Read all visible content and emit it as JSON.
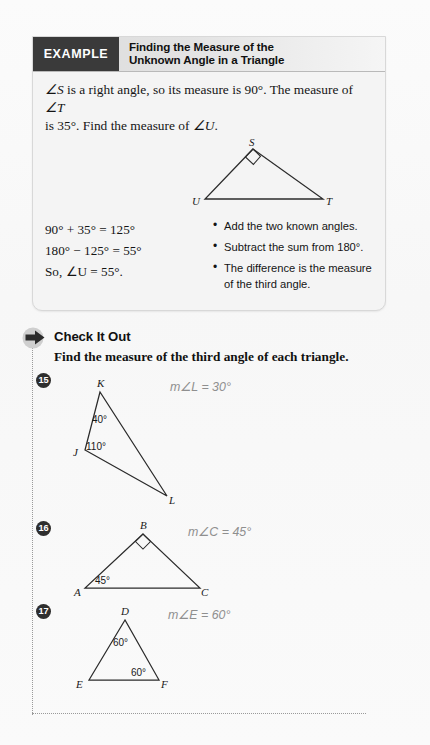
{
  "example": {
    "tag_label": "EXAMPLE",
    "title_line1": "Finding the Measure of the",
    "title_line2": "Unknown Angle in a Triangle",
    "problem_text_part1": "S",
    "problem_text": "∠S is a right angle, so its measure is 90°. The measure of ∠T is 35°. Find the measure of ∠U.",
    "figure": {
      "name": "right-triangle-SUT",
      "vertices": [
        {
          "label": "S",
          "x": 208,
          "y": 12
        },
        {
          "label": "U",
          "x": 160,
          "y": 62
        },
        {
          "label": "T",
          "x": 278,
          "y": 62
        }
      ],
      "right_angle_at": "S"
    },
    "steps": [
      "90° + 35° = 125°",
      "180° − 125° = 55°",
      "So, ∠U = 55°."
    ],
    "notes": [
      "Add the two known angles.",
      "Subtract the sum from 180°.",
      "The difference is the measure of the third angle."
    ],
    "bullet_glyph": "•"
  },
  "check_it_out": {
    "arrow_icon": "right-arrow-icon",
    "heading": "Check It Out",
    "instruction": "Find the measure of the third angle of each triangle.",
    "problems": [
      {
        "number": "15",
        "answer": "m∠L = 30°",
        "figure_name": "triangle-JKL",
        "vertices": [
          {
            "label": "K",
            "x": 45,
            "y": 22
          },
          {
            "label": "J",
            "x": 30,
            "y": 80
          },
          {
            "label": "L",
            "x": 112,
            "y": 126
          }
        ],
        "angles": [
          {
            "value": "40°",
            "at": "K"
          },
          {
            "value": "110°",
            "at": "J"
          }
        ],
        "right_angle_at": ""
      },
      {
        "number": "16",
        "answer": "m∠C = 45°",
        "figure_name": "triangle-ABC",
        "vertices": [
          {
            "label": "B",
            "x": 88,
            "y": 18
          },
          {
            "label": "A",
            "x": 30,
            "y": 72
          },
          {
            "label": "C",
            "x": 145,
            "y": 72
          }
        ],
        "angles": [
          {
            "value": "45°",
            "at": "A"
          }
        ],
        "right_angle_at": "B"
      },
      {
        "number": "17",
        "answer": "m∠E = 60°",
        "figure_name": "triangle-DEF",
        "vertices": [
          {
            "label": "D",
            "x": 70,
            "y": 18
          },
          {
            "label": "E",
            "x": 34,
            "y": 78
          },
          {
            "label": "F",
            "x": 104,
            "y": 78
          }
        ],
        "angles": [
          {
            "value": "60°",
            "at": "D"
          },
          {
            "value": "60°",
            "at": "F"
          }
        ],
        "right_angle_at": ""
      }
    ]
  },
  "colors": {
    "tag_bg": "#3a3a3a",
    "answer_gray": "#8f8f8f",
    "rule_gray": "#9a9a9a",
    "ink": "#141414"
  }
}
